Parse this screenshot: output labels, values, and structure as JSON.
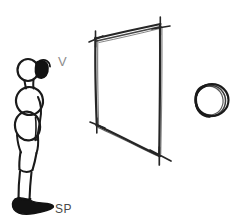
{
  "image": {
    "kind": "hand-drawn-sketch-diagram",
    "width": 240,
    "height": 224,
    "background_color": "#ffffff",
    "ink_color": "#1a1a1a"
  },
  "labels": {
    "viewpoint": {
      "text": "V",
      "color": "#8d8d8d",
      "x": 62,
      "y": 62
    },
    "standpoint": {
      "text": "SP",
      "color": "#4a4a4a",
      "x": 62,
      "y": 209
    }
  },
  "figure": {
    "name": "standing-person-side-view",
    "parts": [
      "head",
      "hair-bun",
      "neck",
      "chest-oval",
      "hip-oval",
      "arm",
      "leg",
      "foot"
    ],
    "color": "#1a1a1a"
  },
  "quadrilateral": {
    "name": "perspective-plane",
    "description": "Hand drawn quadrilateral in perspective, a picture plane, with cross ticks at each corner",
    "corners": {
      "top_left": [
        96,
        38
      ],
      "top_right": [
        160,
        24
      ],
      "bottom_right": [
        159,
        155
      ],
      "bottom_left": [
        97,
        125
      ]
    },
    "corner_marks": 4,
    "color": "#262626"
  },
  "circle": {
    "name": "sketched-circle",
    "description": "Loose multi-stroke hand drawn circle",
    "center": [
      212,
      100
    ],
    "radius": 17,
    "color": "#1a1a1a"
  }
}
